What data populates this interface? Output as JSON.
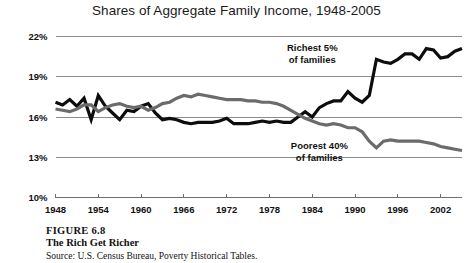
{
  "chart_data": {
    "type": "line",
    "title": "Shares of Aggregate Family Income, 1948-2005",
    "xlabel": "",
    "ylabel": "",
    "xlim": [
      1948,
      2005
    ],
    "ylim": [
      10,
      22
    ],
    "ytick_labels": [
      "22%",
      "19%",
      "16%",
      "13%",
      "10%"
    ],
    "ytick_values": [
      22,
      19,
      16,
      13,
      10
    ],
    "xtick_labels": [
      "1948",
      "1954",
      "1960",
      "1966",
      "1972",
      "1978",
      "1984",
      "1990",
      "1996",
      "2002"
    ],
    "xtick_values": [
      1948,
      1954,
      1960,
      1966,
      1972,
      1978,
      1984,
      1990,
      1996,
      2002
    ],
    "grid": true,
    "legend_position": "inline-annotations",
    "series": [
      {
        "name": "Richest 5% of families",
        "color": "#0d0d0d",
        "line_width": 3.2,
        "annotation": {
          "line1": "Richest 5%",
          "line2": "of families",
          "x": 1984,
          "y": 20.9
        },
        "x": [
          1948,
          1949,
          1950,
          1951,
          1952,
          1953,
          1954,
          1955,
          1956,
          1957,
          1958,
          1959,
          1960,
          1961,
          1962,
          1963,
          1964,
          1965,
          1966,
          1967,
          1968,
          1969,
          1970,
          1971,
          1972,
          1973,
          1974,
          1975,
          1976,
          1977,
          1978,
          1979,
          1980,
          1981,
          1982,
          1983,
          1984,
          1985,
          1986,
          1987,
          1988,
          1989,
          1990,
          1991,
          1992,
          1993,
          1994,
          1995,
          1996,
          1997,
          1998,
          1999,
          2000,
          2001,
          2002,
          2003,
          2004,
          2005
        ],
        "y": [
          17.1,
          16.9,
          17.3,
          16.8,
          17.4,
          15.8,
          17.6,
          16.8,
          16.3,
          15.8,
          16.5,
          16.4,
          16.8,
          17.0,
          16.3,
          15.8,
          15.9,
          15.8,
          15.6,
          15.5,
          15.6,
          15.6,
          15.6,
          15.7,
          15.9,
          15.5,
          15.5,
          15.5,
          15.6,
          15.7,
          15.6,
          15.7,
          15.6,
          15.6,
          16.0,
          16.4,
          16.0,
          16.7,
          17.0,
          17.2,
          17.2,
          17.9,
          17.4,
          17.1,
          17.6,
          20.3,
          20.1,
          20.0,
          20.3,
          20.7,
          20.7,
          20.3,
          21.1,
          21.0,
          20.4,
          20.5,
          20.9,
          21.1
        ]
      },
      {
        "name": "Poorest 40% of families",
        "color": "#6b6b6b",
        "line_width": 3.2,
        "annotation": {
          "line1": "Poorest 40%",
          "line2": "of families",
          "x": 1985,
          "y": 13.6
        },
        "x": [
          1948,
          1949,
          1950,
          1951,
          1952,
          1953,
          1954,
          1955,
          1956,
          1957,
          1958,
          1959,
          1960,
          1961,
          1962,
          1963,
          1964,
          1965,
          1966,
          1967,
          1968,
          1969,
          1970,
          1971,
          1972,
          1973,
          1974,
          1975,
          1976,
          1977,
          1978,
          1979,
          1980,
          1981,
          1982,
          1983,
          1984,
          1985,
          1986,
          1987,
          1988,
          1989,
          1990,
          1991,
          1992,
          1993,
          1994,
          1995,
          1996,
          1997,
          1998,
          1999,
          2000,
          2001,
          2002,
          2003,
          2004,
          2005
        ],
        "y": [
          16.6,
          16.5,
          16.4,
          16.6,
          16.9,
          16.9,
          16.4,
          16.7,
          16.9,
          17.0,
          16.8,
          16.7,
          16.8,
          16.5,
          16.7,
          17.0,
          17.1,
          17.4,
          17.6,
          17.5,
          17.7,
          17.6,
          17.5,
          17.4,
          17.3,
          17.3,
          17.3,
          17.2,
          17.2,
          17.1,
          17.1,
          17.0,
          16.8,
          16.5,
          16.2,
          15.9,
          15.7,
          15.5,
          15.4,
          15.5,
          15.4,
          15.2,
          15.2,
          14.9,
          14.2,
          13.7,
          14.2,
          14.3,
          14.2,
          14.2,
          14.2,
          14.2,
          14.1,
          14.0,
          13.8,
          13.7,
          13.6,
          13.5
        ]
      }
    ]
  },
  "caption": {
    "figure_number": "FIGURE 6.8",
    "title": "The Rich Get Richer",
    "source": "Source: U.S. Census Bureau, Poverty Historical Tables."
  },
  "colors": {
    "background": "#ffffff",
    "gridline": "#8c8c8c",
    "text": "#111111",
    "series_richest": "#0d0d0d",
    "series_poorest": "#6b6b6b"
  }
}
